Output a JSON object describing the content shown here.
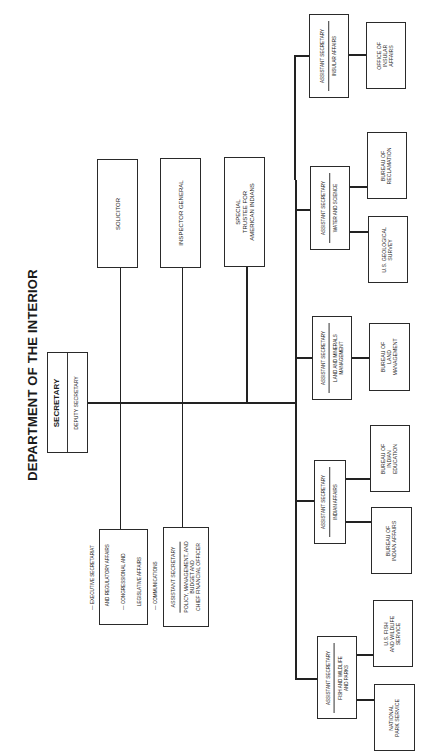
{
  "title": "DEPARTMENT OF THE INTERIOR",
  "secretary": {
    "title": "SECRETARY",
    "deputy": "DEPUTY SECRETARY"
  },
  "staff_offices": [
    {
      "label": "SOLICITOR"
    },
    {
      "label": "INSPECTOR GENERAL"
    },
    {
      "label_lines": [
        "SPECIAL",
        "TRUSTEE FOR",
        "AMERICAN INDIANS"
      ]
    }
  ],
  "executive_box": {
    "items": [
      "— EXECUTIVE SECRETARIAT",
      "   AND REGULATORY AFFAIRS",
      "— CONGRESSIONAL AND",
      "   LEGISLATIVE AFFAIRS",
      "— COMMUNICATIONS"
    ]
  },
  "pmb": {
    "title": "ASSISTANT SECRETARY",
    "lines": [
      "POLICY, MANAGEMENT, AND",
      "BUDGET AND",
      "CHIEF FINANCIAL OFFICER"
    ]
  },
  "assistant_secretaries": [
    {
      "title": "ASSISTANT SECRETARY",
      "area_lines": [
        "INSULAR AFFAIRS"
      ],
      "bureaus": [
        {
          "lines": [
            "OFFICE OF",
            "INSULAR",
            "AFFAIRS"
          ]
        }
      ]
    },
    {
      "title": "ASSISTANT SECRETARY",
      "area_lines": [
        "WATER AND SCIENCE"
      ],
      "bureaus": [
        {
          "lines": [
            "BUREAU OF",
            "RECLAMATION"
          ]
        },
        {
          "lines": [
            "U.S. GEOLOGICAL",
            "SURVEY"
          ]
        }
      ]
    },
    {
      "title": "ASSISTANT SECRETARY",
      "area_lines": [
        "LAND AND MINERALS",
        "MANAGEMENT"
      ],
      "bureaus": [
        {
          "lines": [
            "BUREAU OF",
            "LAND",
            "MANAGEMENT"
          ]
        }
      ]
    },
    {
      "title": "ASSISTANT SECRETARY",
      "area_lines": [
        "INDIAN AFFAIRS"
      ],
      "bureaus": [
        {
          "lines": [
            "BUREAU OF",
            "INDIAN",
            "EDUCATION"
          ]
        },
        {
          "lines": [
            "BUREAU OF",
            "INDIAN AFFAIRS"
          ]
        }
      ]
    },
    {
      "title": "ASSISTANT SECRETARY",
      "area_lines": [
        "FISH AND WILDLIFE",
        "AND PARKS"
      ],
      "bureaus": [
        {
          "lines": [
            "U.S. FISH",
            "AND WILDLIFE",
            "SERVICE"
          ]
        },
        {
          "lines": [
            "NATIONAL",
            "PARK SERVICE"
          ]
        }
      ]
    }
  ]
}
